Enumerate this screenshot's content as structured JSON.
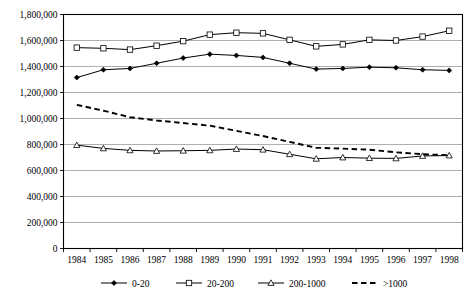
{
  "chart_data": {
    "type": "line",
    "title": "",
    "xlabel": "",
    "ylabel": "",
    "grid": true,
    "legend_position": "bottom",
    "x": [
      1984,
      1985,
      1986,
      1987,
      1988,
      1989,
      1990,
      1991,
      1992,
      1993,
      1994,
      1995,
      1996,
      1997,
      1998
    ],
    "categories": [
      "1984",
      "1985",
      "1986",
      "1987",
      "1988",
      "1989",
      "1990",
      "1991",
      "1992",
      "1993",
      "1994",
      "1995",
      "1996",
      "1997",
      "1998"
    ],
    "ylim": [
      0,
      1800000
    ],
    "ytick_values": [
      0,
      200000,
      400000,
      600000,
      800000,
      1000000,
      1200000,
      1400000,
      1600000,
      1800000
    ],
    "ytick_labels": [
      "0",
      "200,000",
      "400,000",
      "600,000",
      "800,000",
      "1,000,000",
      "1,200,000",
      "1,400,000",
      "1,600,000",
      "1,800,000"
    ],
    "series": [
      {
        "name": "0-20",
        "marker": "filled-diamond",
        "style": "solid",
        "values": [
          1315000,
          1375000,
          1385000,
          1425000,
          1465000,
          1495000,
          1485000,
          1470000,
          1425000,
          1380000,
          1385000,
          1395000,
          1390000,
          1375000,
          1370000
        ]
      },
      {
        "name": "20-200",
        "marker": "open-square",
        "style": "solid",
        "values": [
          1545000,
          1540000,
          1530000,
          1560000,
          1595000,
          1645000,
          1660000,
          1655000,
          1605000,
          1555000,
          1570000,
          1605000,
          1600000,
          1630000,
          1675000
        ]
      },
      {
        "name": "200-1000",
        "marker": "open-triangle",
        "style": "solid",
        "values": [
          795000,
          770000,
          755000,
          750000,
          752000,
          755000,
          765000,
          760000,
          725000,
          690000,
          700000,
          695000,
          693000,
          712000,
          715000
        ]
      },
      {
        "name": ">1000",
        "marker": "none",
        "style": "dashed",
        "values": [
          1105000,
          1060000,
          1010000,
          985000,
          965000,
          945000,
          905000,
          865000,
          820000,
          775000,
          768000,
          760000,
          740000,
          725000,
          718000
        ]
      }
    ]
  },
  "legend": {
    "items": [
      {
        "label": "0-20"
      },
      {
        "label": "20-200"
      },
      {
        "label": "200-1000"
      },
      {
        "label": ">1000"
      }
    ]
  }
}
